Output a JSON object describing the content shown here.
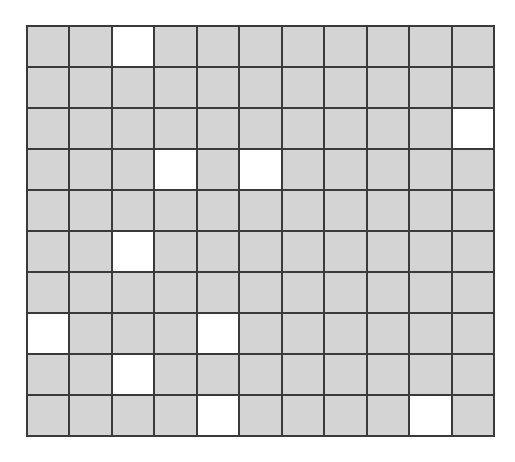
{
  "grid": {
    "rows": 10,
    "cols": 11,
    "filled_color": "#d4d4d4",
    "empty_color": "#ffffff",
    "line_color": "#3a3a3a",
    "white_cells": [
      [
        0,
        2
      ],
      [
        2,
        10
      ],
      [
        3,
        3
      ],
      [
        3,
        5
      ],
      [
        5,
        2
      ],
      [
        7,
        0
      ],
      [
        7,
        4
      ],
      [
        8,
        2
      ],
      [
        9,
        4
      ],
      [
        9,
        9
      ]
    ]
  }
}
